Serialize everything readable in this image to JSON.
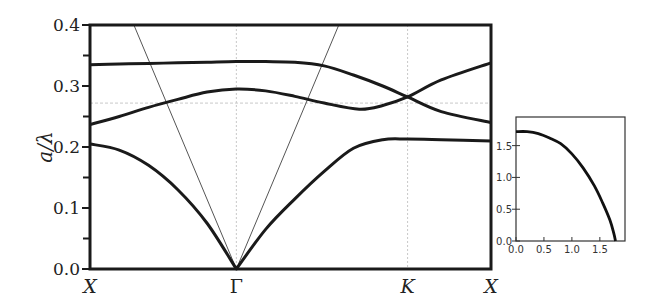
{
  "chart_data": [
    {
      "type": "line",
      "title": "",
      "xlabel": "",
      "ylabel": "a/λ",
      "ylim": [
        0.0,
        0.4
      ],
      "y_ticks": [
        "0.0",
        "0.1",
        "0.2",
        "0.3",
        "0.4"
      ],
      "x_ticks": [
        "X",
        "Γ",
        "K",
        "X"
      ],
      "x_tick_positions": [
        0,
        1,
        2.17,
        2.74
      ],
      "grid": false,
      "reference_lines": {
        "vertical_dashed_at": [
          "Γ",
          "K"
        ],
        "horizontal_dashed_y": 0.272,
        "light_cone_lines": [
          {
            "from": [
              0.3,
              0.4
            ],
            "to": [
              1,
              0.0
            ]
          },
          {
            "from": [
              1.7,
              0.4
            ],
            "to": [
              1,
              0.0
            ]
          }
        ]
      },
      "series": [
        {
          "name": "band-1",
          "x": [
            0,
            0.2,
            0.4,
            0.6,
            0.8,
            1.0,
            1.2,
            1.4,
            1.6,
            1.8,
            2.0,
            2.17,
            2.4,
            2.74
          ],
          "values": [
            0.205,
            0.195,
            0.17,
            0.13,
            0.075,
            0.0,
            0.065,
            0.115,
            0.16,
            0.198,
            0.212,
            0.213,
            0.212,
            0.21
          ]
        },
        {
          "name": "band-2",
          "x": [
            0,
            0.2,
            0.4,
            0.6,
            0.8,
            1.0,
            1.2,
            1.4,
            1.6,
            1.84,
            2.0,
            2.17,
            2.4,
            2.74
          ],
          "values": [
            0.237,
            0.25,
            0.265,
            0.278,
            0.29,
            0.295,
            0.292,
            0.283,
            0.272,
            0.262,
            0.268,
            0.282,
            0.31,
            0.338
          ]
        },
        {
          "name": "band-3",
          "x": [
            0,
            0.2,
            0.4,
            0.6,
            0.8,
            1.0,
            1.2,
            1.4,
            1.6,
            1.8,
            2.0,
            2.17,
            2.4,
            2.74
          ],
          "values": [
            0.335,
            0.336,
            0.337,
            0.338,
            0.339,
            0.34,
            0.34,
            0.339,
            0.333,
            0.318,
            0.3,
            0.282,
            0.258,
            0.24
          ]
        }
      ]
    },
    {
      "type": "line",
      "title": "",
      "xlabel": "",
      "ylabel": "",
      "xlim": [
        0.0,
        1.95
      ],
      "ylim": [
        0.0,
        1.95
      ],
      "x_ticks": [
        "0.0",
        "0.5",
        "1.0",
        "1.5"
      ],
      "y_ticks": [
        "0.0",
        "0.5",
        "1.0",
        "1.5"
      ],
      "series": [
        {
          "name": "inset-curve",
          "x": [
            0.0,
            0.2,
            0.4,
            0.6,
            0.8,
            1.0,
            1.2,
            1.4,
            1.55,
            1.68,
            1.75,
            1.78
          ],
          "values": [
            1.72,
            1.72,
            1.69,
            1.62,
            1.53,
            1.37,
            1.15,
            0.87,
            0.6,
            0.33,
            0.12,
            0.0
          ]
        }
      ]
    }
  ],
  "labels": {
    "y_axis": "a/λ",
    "sym_points": [
      "X",
      "Γ",
      "K",
      "X"
    ]
  }
}
